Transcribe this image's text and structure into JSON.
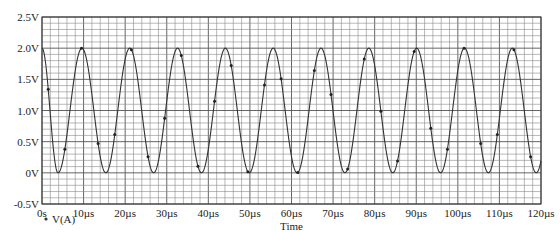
{
  "chart_data": {
    "type": "line",
    "title": "",
    "xlabel": "Time",
    "ylabel": "",
    "xlim": [
      0,
      120
    ],
    "ylim": [
      -0.5,
      2.5
    ],
    "x_unit": "µs",
    "y_unit": "V",
    "grid": true,
    "grid_minor_x_step": 2,
    "grid_minor_y_step": 0.1,
    "grid_major_x_step": 10,
    "grid_major_y_step": 0.5,
    "x_ticks": [
      0,
      10,
      20,
      30,
      40,
      50,
      60,
      70,
      80,
      90,
      100,
      110,
      120
    ],
    "x_tick_labels": [
      "0s",
      "10µs",
      "20µs",
      "30µs",
      "40µs",
      "50µs",
      "60µs",
      "70µs",
      "80µs",
      "90µs",
      "100µs",
      "110µs",
      "120µs"
    ],
    "y_ticks": [
      -0.5,
      0,
      0.5,
      1.0,
      1.5,
      2.0,
      2.5
    ],
    "y_tick_labels": [
      "-0.5V",
      "0V",
      "0.5V",
      "1.0V",
      "1.5V",
      "2.0V",
      "2.5V"
    ],
    "legend": {
      "position": "bottom-left",
      "entries": [
        "V(A)"
      ]
    },
    "series": [
      {
        "name": "V(A)",
        "shape": "sinusoid",
        "offset_v": 1.0,
        "amplitude_v": 1.0,
        "period_us": 11.5,
        "peak_time_us": 9.6,
        "start_value_v": 2.0,
        "first_trough_us": 3.85,
        "note": "Offset, amplitude and period are read from the grid. The trace starts at 2.0V at t=0, which a single cosine with these fitted peak/trough times does not reproduce; the 0-3.85µs segment is drawn as observed and may be a startup transient.",
        "peaks_us": [
          9.6,
          21.1,
          32.6,
          44.1,
          55.6,
          67.1,
          78.6,
          90.1,
          101.6,
          113.1
        ],
        "troughs_us": [
          3.85,
          15.35,
          26.85,
          38.35,
          49.85,
          61.35,
          72.85,
          84.35,
          95.85,
          107.35,
          118.85
        ],
        "marker_interval_us": 4.0,
        "color": "#333333"
      }
    ]
  },
  "legend": {
    "series_label": "V(A)"
  },
  "axes": {
    "x_title": "Time"
  }
}
